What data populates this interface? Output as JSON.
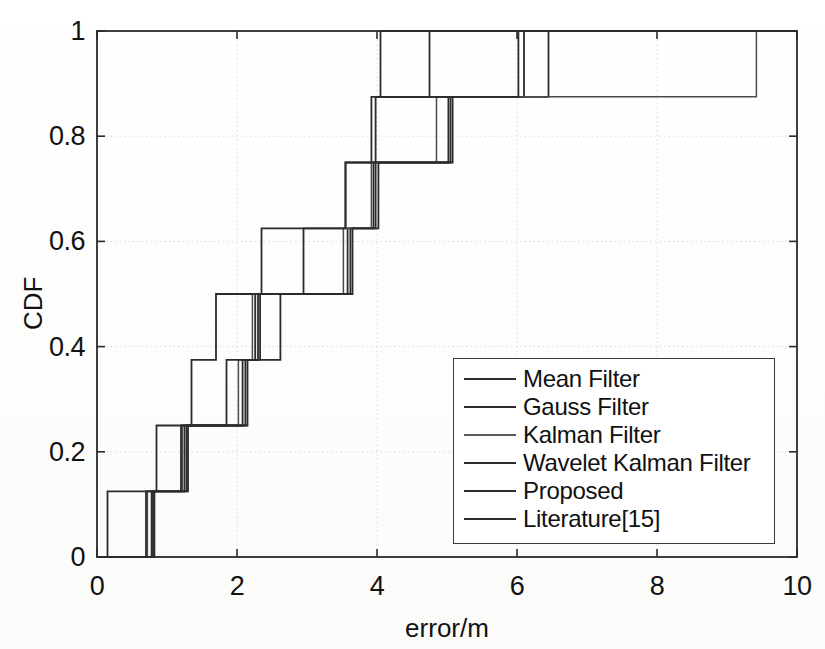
{
  "chart_data": {
    "type": "line",
    "subtype": "step-cdf",
    "title": "",
    "xlabel": "error/m",
    "ylabel": "CDF",
    "xlim": [
      0,
      10
    ],
    "ylim": [
      0,
      1
    ],
    "xticks": [
      "0",
      "2",
      "4",
      "6",
      "8",
      "10"
    ],
    "xtick_values": [
      0,
      2,
      4,
      6,
      8,
      10
    ],
    "yticks": [
      "0",
      "0.2",
      "0.4",
      "0.6",
      "0.8",
      "1"
    ],
    "ytick_values": [
      0,
      0.2,
      0.4,
      0.6,
      0.8,
      1
    ],
    "grid": true,
    "grid_style": "dotted",
    "legend_position": "lower-right",
    "step_increment": 0.125,
    "n_samples_per_series": 8,
    "series": [
      {
        "name": "Mean Filter",
        "color": "#2b2b2b",
        "x": [
          0.8,
          1.28,
          2.12,
          2.3,
          3.62,
          3.95,
          5.05,
          6.45
        ],
        "y": [
          0.125,
          0.25,
          0.375,
          0.5,
          0.625,
          0.75,
          0.875,
          1.0
        ]
      },
      {
        "name": "Gauss Filter",
        "color": "#2b2b2b",
        "x": [
          0.78,
          1.25,
          2.08,
          2.26,
          3.58,
          3.98,
          5.02,
          6.1
        ],
        "y": [
          0.125,
          0.25,
          0.375,
          0.5,
          0.625,
          0.75,
          0.875,
          1.0
        ]
      },
      {
        "name": "Kalman Filter",
        "color": "#4a4a4a",
        "x": [
          0.72,
          1.22,
          2.02,
          2.22,
          3.52,
          3.92,
          4.85,
          9.42
        ],
        "y": [
          0.125,
          0.25,
          0.375,
          0.5,
          0.625,
          0.75,
          0.875,
          1.0
        ]
      },
      {
        "name": "Wavelet Kalman Filter",
        "color": "#2b2b2b",
        "x": [
          0.7,
          1.2,
          1.85,
          2.62,
          2.95,
          3.55,
          3.92,
          6.02
        ],
        "y": [
          0.125,
          0.25,
          0.375,
          0.5,
          0.625,
          0.75,
          0.875,
          1.0
        ]
      },
      {
        "name": "Proposed",
        "color": "#2b2b2b",
        "x": [
          0.15,
          0.85,
          1.35,
          1.7,
          2.35,
          3.55,
          3.98,
          4.75
        ],
        "y": [
          0.125,
          0.25,
          0.375,
          0.5,
          0.625,
          0.75,
          0.875,
          1.0
        ]
      },
      {
        "name": "Literature[15]",
        "color": "#2b2b2b",
        "x": [
          0.82,
          1.3,
          2.15,
          2.33,
          3.65,
          4.02,
          5.08,
          4.05
        ],
        "y": [
          0.125,
          0.25,
          0.375,
          0.5,
          0.625,
          0.75,
          0.875,
          1.0
        ]
      }
    ]
  },
  "legend": {
    "entries": [
      {
        "label": "Mean Filter",
        "faint": false
      },
      {
        "label": "Gauss Filter",
        "faint": false
      },
      {
        "label": "Kalman Filter",
        "faint": true
      },
      {
        "label": "Wavelet Kalman Filter",
        "faint": false
      },
      {
        "label": "Proposed",
        "faint": false
      },
      {
        "label": "Literature[15]",
        "faint": false
      }
    ]
  },
  "caption": {
    "text": ""
  },
  "colors": {
    "line": "#2b2b2b",
    "axis": "#2b2b2b",
    "grid": "#d9d9d9",
    "background": "#ffffff",
    "text": "#111111"
  },
  "geometry": {
    "plot_left": 97,
    "plot_right": 797,
    "plot_top": 31,
    "plot_bottom": 557,
    "legend_left": 453,
    "legend_top": 358,
    "legend_width": 322,
    "legend_height": 186
  }
}
